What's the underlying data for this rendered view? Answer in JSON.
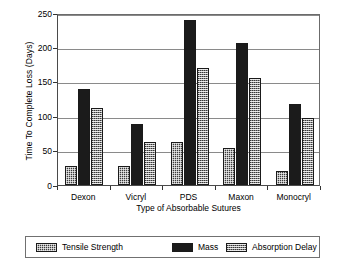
{
  "chart_data": {
    "type": "bar",
    "title": "",
    "xlabel": "Type of Absorbable Sutures",
    "ylabel": "Time To Complete Loss (Days)",
    "categories": [
      "Dexon",
      "Vicryl",
      "PDS",
      "Maxon",
      "Monocryl"
    ],
    "series": [
      {
        "name": "Tensile Strength",
        "values": [
          28,
          28,
          62,
          54,
          21
        ],
        "pattern": "dark-checker",
        "color": "#3b3b3b"
      },
      {
        "name": "Mass",
        "values": [
          140,
          88,
          240,
          207,
          118
        ],
        "pattern": "solid",
        "color": "#1b1b1b"
      },
      {
        "name": "Absorption Delay",
        "values": [
          112,
          63,
          170,
          155,
          98
        ],
        "pattern": "light-checker",
        "color": "#8c8c8c"
      }
    ],
    "ylim": [
      0,
      250
    ],
    "yticks": [
      0,
      50,
      100,
      150,
      200,
      250
    ],
    "ytick_labels": [
      "0",
      "50",
      "100",
      "150",
      "200",
      "250"
    ],
    "grid": true,
    "legend_position": "below-axes"
  },
  "legend": {
    "entries": [
      {
        "label": "Tensile Strength"
      },
      {
        "label": "Mass"
      },
      {
        "label": "Absorption Delay"
      }
    ]
  }
}
